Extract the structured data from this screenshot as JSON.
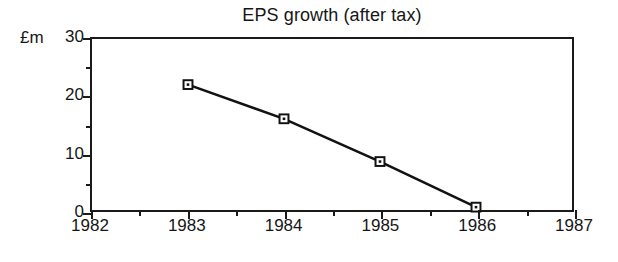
{
  "chart_data": {
    "type": "line",
    "title": "EPS growth (after tax)",
    "xlabel": "",
    "ylabel": "£m",
    "y_unit_label": "£m",
    "x": [
      1983,
      1984,
      1985,
      1986
    ],
    "categories": [
      "1983",
      "1984",
      "1985",
      "1986"
    ],
    "values": [
      22,
      16,
      8.5,
      0.5
    ],
    "series": [
      {
        "name": "EPS growth (after tax)",
        "values": [
          22,
          16,
          8.5,
          0.5
        ]
      }
    ],
    "xlim": [
      1982,
      1987
    ],
    "ylim": [
      0,
      30
    ],
    "x_major_ticks": [
      1982,
      1983,
      1984,
      1985,
      1986,
      1987
    ],
    "x_minor_ticks": [
      1982.5,
      1983.5,
      1984.5,
      1985.5,
      1986.5
    ],
    "x_tick_labels": [
      "1982",
      "1983",
      "1984",
      "1985",
      "1986",
      "1987"
    ],
    "y_major_ticks": [
      0,
      10,
      20,
      30
    ],
    "y_minor_ticks": [
      5,
      15,
      25
    ],
    "y_tick_labels": [
      "0",
      "10",
      "20",
      "30"
    ],
    "grid": false,
    "legend": "none",
    "marker": "square-with-center-dot",
    "line_color": "#121212",
    "marker_fill": "#ffffff",
    "marker_stroke": "#121212",
    "background_color": "#ffffff",
    "axis_color": "#1a1a1a"
  }
}
